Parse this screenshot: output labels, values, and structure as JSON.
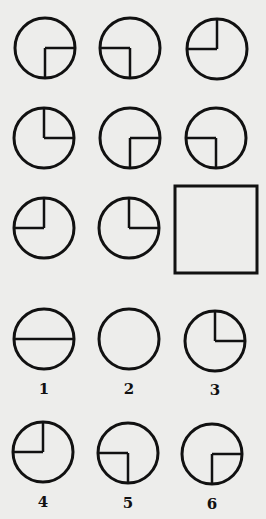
{
  "puzzle": {
    "grid": [
      {
        "cx": 45,
        "cy": 48,
        "quadrant": "bottom-right"
      },
      {
        "cx": 130,
        "cy": 48,
        "quadrant": "bottom-left"
      },
      {
        "cx": 217,
        "cy": 49,
        "quadrant": "top-left"
      },
      {
        "cx": 44,
        "cy": 138,
        "quadrant": "top-right"
      },
      {
        "cx": 130,
        "cy": 138,
        "quadrant": "bottom-right"
      },
      {
        "cx": 216,
        "cy": 138,
        "quadrant": "bottom-left"
      },
      {
        "cx": 44,
        "cy": 228,
        "quadrant": "top-left"
      },
      {
        "cx": 129,
        "cy": 228,
        "quadrant": "top-right"
      }
    ],
    "blank": {
      "x": 175,
      "y": 186,
      "w": 82,
      "h": 87
    },
    "options": [
      {
        "label": "1",
        "cx": 44,
        "cy": 339,
        "shape": "horizontal-diameter"
      },
      {
        "label": "2",
        "cx": 129,
        "cy": 339,
        "shape": "empty"
      },
      {
        "label": "3",
        "cx": 215,
        "cy": 341,
        "quadrant": "top-right"
      },
      {
        "label": "4",
        "cx": 43,
        "cy": 452,
        "quadrant": "top-left"
      },
      {
        "label": "5",
        "cx": 128,
        "cy": 453,
        "quadrant": "bottom-left"
      },
      {
        "label": "6",
        "cx": 212,
        "cy": 454,
        "quadrant": "bottom-right"
      }
    ],
    "radius": 30,
    "stroke_color": "#111111"
  }
}
